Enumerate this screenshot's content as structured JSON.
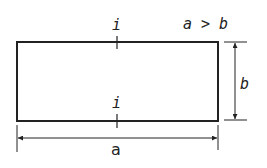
{
  "diagram": {
    "condition": "a > b",
    "labels": {
      "top_section": "i",
      "bottom_section": "i",
      "height": "b",
      "width": "a"
    },
    "rectangle": {
      "x": 17,
      "y": 42,
      "width": 201,
      "height": 79
    },
    "colors": {
      "stroke": "#222222",
      "background": "#ffffff"
    }
  }
}
